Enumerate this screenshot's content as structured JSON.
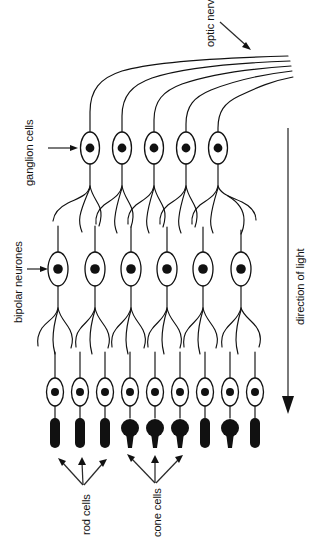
{
  "diagram": {
    "labels": {
      "optic_nerve": "optic nerve",
      "ganglion_cells": "ganglion cells",
      "bipolar_neurones": "bipolar neurones",
      "direction_of_light": "direction of light",
      "rod_cells": "rod cells",
      "cone_cells": "cone cells"
    },
    "colors": {
      "ink": "#111111",
      "background": "#ffffff",
      "arrow": "#2b2b2b"
    },
    "layers": {
      "optic_nerve_fibres": 5,
      "ganglion_cells": 5,
      "bipolar_neurones": 6,
      "photoreceptors": 9
    },
    "photoreceptor_sequence": [
      "rod",
      "rod",
      "rod",
      "cone",
      "cone",
      "cone",
      "rod",
      "cone",
      "rod"
    ]
  }
}
